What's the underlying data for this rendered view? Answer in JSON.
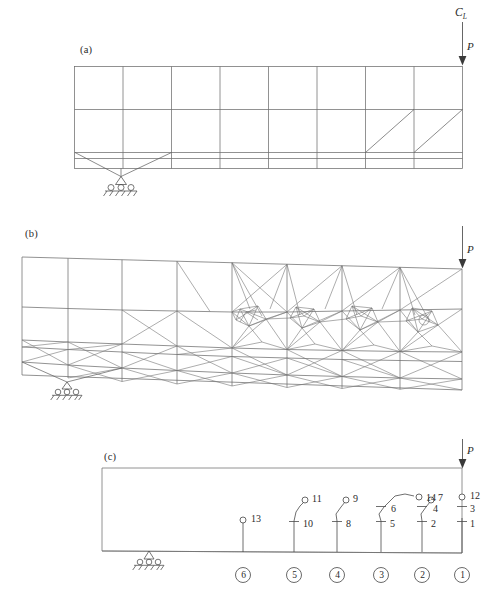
{
  "figure": {
    "background_color": "#ffffff",
    "line_color": "#6e6e6e",
    "text_color": "#2a2a2a",
    "panels": [
      {
        "id": "a",
        "label": "(a)",
        "caption_x": 80,
        "caption_y": 44
      },
      {
        "id": "b",
        "label": "(b)",
        "caption_x": 25,
        "caption_y": 228
      },
      {
        "id": "c",
        "label": "(c)",
        "caption_x": 104,
        "caption_y": 451
      }
    ],
    "centerline_label": "C",
    "centerline_subscript": "L",
    "load_label": "P",
    "loads": [
      {
        "panel": "a",
        "label": "P",
        "x": 463,
        "y": 65
      },
      {
        "panel": "b",
        "label": "P",
        "x": 463,
        "y": 272
      },
      {
        "panel": "c",
        "label": "P",
        "x": 463,
        "y": 468
      }
    ]
  },
  "panel_a": {
    "name": "initial-coarse-mesh",
    "columns": 8,
    "rows": 3,
    "support_type": "pinned-hatched",
    "support_x": 121,
    "diagonals_right": 2
  },
  "panel_b": {
    "name": "deformed-adaptive-refined-mesh",
    "support_type": "pinned-hatched",
    "support_x": 67
  },
  "panel_c": {
    "name": "design-variable-grouping-diagram",
    "support_type": "pinned-hatched",
    "support_x": 149,
    "node_labels": [
      "1",
      "2",
      "3",
      "4",
      "5",
      "6",
      "7",
      "8",
      "9",
      "10",
      "11",
      "12",
      "13",
      "14"
    ],
    "group_labels": [
      "1",
      "2",
      "3",
      "4",
      "5",
      "6"
    ],
    "stations": [
      {
        "group": "6",
        "x": 243,
        "numbers": [
          "13"
        ]
      },
      {
        "group": "5",
        "x": 294,
        "numbers": [
          "10",
          "11"
        ]
      },
      {
        "group": "4",
        "x": 337,
        "numbers": [
          "8",
          "9"
        ]
      },
      {
        "group": "3",
        "x": 381,
        "numbers": [
          "5",
          "6",
          "14"
        ]
      },
      {
        "group": "2",
        "x": 422,
        "numbers": [
          "2",
          "4",
          "7"
        ]
      },
      {
        "group": "1",
        "x": 461,
        "numbers": [
          "1",
          "3",
          "12"
        ]
      }
    ]
  }
}
